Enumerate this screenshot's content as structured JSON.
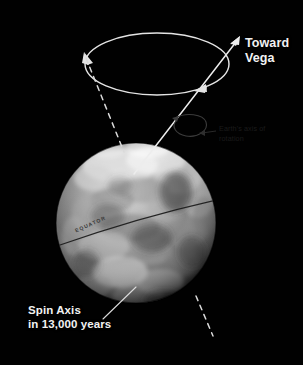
{
  "figure": {
    "background_color": "#010101",
    "width": 303,
    "height": 365
  },
  "labels": {
    "toward_vega": "Toward\nVega",
    "spin_axis": "Spin Axis\nin 13,000 years",
    "earth_axis_of_rotation": "Earth's axis of\nrotation",
    "equator": "EQUATOR"
  },
  "colors": {
    "label_text": "#f2f2f2",
    "faint_text": "#1b1b1b",
    "line": "#e8e8e8",
    "dashed_line": "#dcdcdc",
    "equator_line": "#2a2a2a",
    "background": "#010101"
  },
  "elements": {
    "precession_circle": "precession-path-ellipse",
    "precession_arrow_left": "arrowhead-counterclockwise-left",
    "precession_arrow_right": "arrowhead-counterclockwise-right",
    "vega_arrow": "vega-direction-arrow",
    "rotation_loop": "earth-rotation-direction-loop",
    "future_axis": "future-spin-axis-dashed-line",
    "current_axis": "current-axis-solid-line",
    "globe": "earth-globe-grayscale",
    "equator_line": "equator-line",
    "spin_axis_leader": "spin-axis-leader-line",
    "rotation_leader": "rotation-label-leader-line"
  },
  "geometry": {
    "globe_center_x": 136,
    "globe_center_y": 223,
    "globe_radius": 80,
    "ellipse_center_x": 157,
    "ellipse_center_y": 64,
    "ellipse_rx": 72,
    "ellipse_ry": 31
  }
}
